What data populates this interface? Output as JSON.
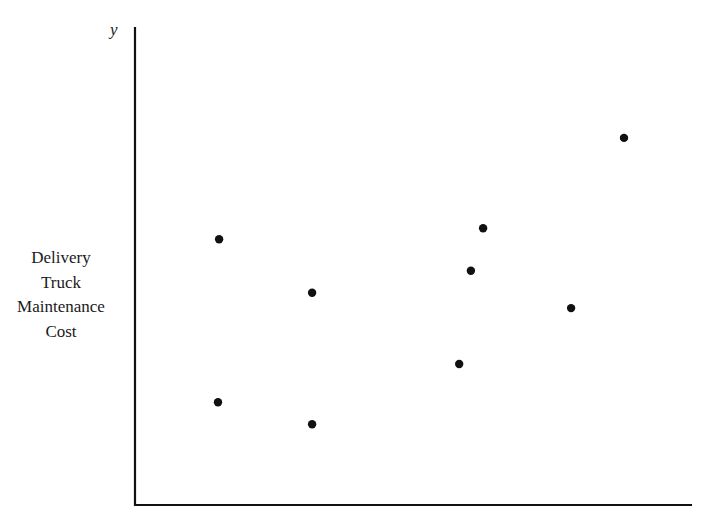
{
  "chart_data": {
    "type": "scatter",
    "title": "",
    "xlabel": "",
    "ylabel": "Delivery Truck Maintenance Cost",
    "ylabel_lines": [
      "Delivery",
      "Truck",
      "Maintenance",
      "Cost"
    ],
    "y_axis_symbol": "y",
    "xlim": [
      0,
      100
    ],
    "ylim": [
      0,
      100
    ],
    "grid": false,
    "legend": null,
    "tick_labels": "none",
    "note": "No numeric ticks shown; values are relative positions (0-100) within the axes.",
    "series": [
      {
        "name": "observations",
        "color": "#111111",
        "points": [
          {
            "x": 15.1,
            "y": 55.6
          },
          {
            "x": 14.9,
            "y": 21.5
          },
          {
            "x": 31.8,
            "y": 44.4
          },
          {
            "x": 31.8,
            "y": 16.9
          },
          {
            "x": 58.2,
            "y": 29.5
          },
          {
            "x": 60.3,
            "y": 49.0
          },
          {
            "x": 62.5,
            "y": 57.9
          },
          {
            "x": 78.3,
            "y": 41.2
          },
          {
            "x": 87.8,
            "y": 76.8
          }
        ]
      }
    ]
  }
}
